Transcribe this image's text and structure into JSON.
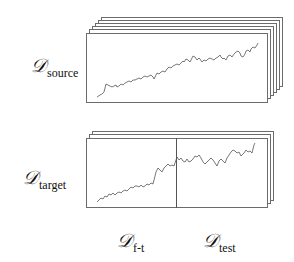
{
  "diagram": {
    "colors": {
      "frame_stroke": "#6b6b6b",
      "series_stroke": "#555555",
      "divider_stroke": "#555555",
      "background": "#ffffff"
    },
    "source_stack": {
      "label_main": "𝒟",
      "label_sub": "source",
      "frame_count": 6
    },
    "target_stack": {
      "label_main": "𝒟",
      "label_sub": "target",
      "frame_count": 3,
      "split_labels": [
        {
          "main": "𝒟",
          "sub": "f-t"
        },
        {
          "main": "𝒟",
          "sub": "test"
        }
      ]
    }
  }
}
